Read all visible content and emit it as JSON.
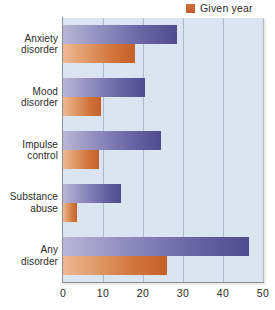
{
  "legend": {
    "items": [
      {
        "label": "Given year",
        "color": "#c4602a",
        "marker": "square-swatch"
      }
    ]
  },
  "axis": {
    "x_ticks": [
      "0",
      "10",
      "20",
      "30",
      "40",
      "50"
    ]
  },
  "categories": [
    {
      "line1": "Anxiety",
      "line2": "disorder"
    },
    {
      "line1": "Mood",
      "line2": "disorder"
    },
    {
      "line1": "Impulse",
      "line2": "control"
    },
    {
      "line1": "Substance",
      "line2": "abuse"
    },
    {
      "line1": "Any",
      "line2": "disorder"
    }
  ],
  "chart_data": {
    "type": "bar",
    "orientation": "horizontal",
    "title": "",
    "xlabel": "",
    "ylabel": "",
    "xlim": [
      0,
      50
    ],
    "xticks": [
      0,
      10,
      20,
      30,
      40,
      50
    ],
    "grid": true,
    "legend_position": "top-right",
    "categories": [
      "Anxiety disorder",
      "Mood disorder",
      "Impulse control",
      "Substance abuse",
      "Any disorder"
    ],
    "series": [
      {
        "name": "Lifetime",
        "color": "#4e4c8e",
        "in_legend": false,
        "values": [
          28.5,
          20.5,
          24.5,
          14.5,
          46.5
        ]
      },
      {
        "name": "Given year",
        "color": "#c4602a",
        "in_legend": true,
        "values": [
          18.0,
          9.5,
          9.0,
          3.5,
          26.0
        ]
      }
    ]
  },
  "colors": {
    "plot_background": "#dbe5f1",
    "gridline": "#9aa9bd",
    "axis_line": "#8b8f94",
    "purple_bar": "#4e4c8e",
    "orange_bar": "#c4602a",
    "text": "#2b2b2b"
  }
}
